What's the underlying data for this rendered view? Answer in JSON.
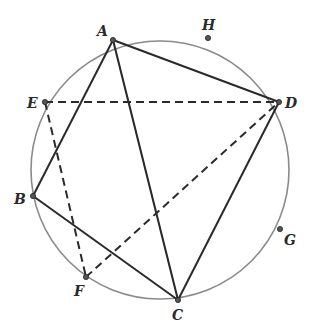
{
  "figure": {
    "circle": {
      "cx": 160,
      "cy": 170,
      "r": 129,
      "color": "#8a8a8a"
    },
    "points": [
      {
        "id": "A",
        "label": "A",
        "x": 113,
        "y": 40,
        "lx": 97,
        "ly": 36
      },
      {
        "id": "H",
        "label": "H",
        "x": 208,
        "y": 38,
        "lx": 202,
        "ly": 30
      },
      {
        "id": "E",
        "label": "E",
        "x": 45,
        "y": 102,
        "lx": 27,
        "ly": 108
      },
      {
        "id": "D",
        "label": "D",
        "x": 279,
        "y": 102,
        "lx": 285,
        "ly": 108
      },
      {
        "id": "B",
        "label": "B",
        "x": 33,
        "y": 196,
        "lx": 14,
        "ly": 204
      },
      {
        "id": "G",
        "label": "G",
        "x": 280,
        "y": 229,
        "lx": 284,
        "ly": 245
      },
      {
        "id": "F",
        "label": "F",
        "x": 86,
        "y": 277,
        "lx": 74,
        "ly": 296
      },
      {
        "id": "C",
        "label": "C",
        "x": 178,
        "y": 300,
        "lx": 172,
        "ly": 320
      }
    ],
    "solid_segments": [
      [
        "A",
        "D"
      ],
      [
        "A",
        "B"
      ],
      [
        "A",
        "C"
      ],
      [
        "B",
        "C"
      ],
      [
        "C",
        "D"
      ]
    ],
    "dashed_segments": [
      [
        "E",
        "D"
      ],
      [
        "E",
        "F"
      ],
      [
        "F",
        "D"
      ]
    ]
  }
}
